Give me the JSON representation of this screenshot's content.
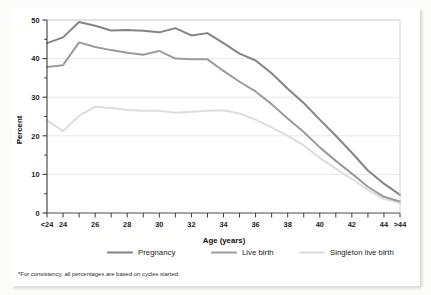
{
  "figure": {
    "footnote": "*For consistency, all percentages are based on cycles started."
  },
  "chart_data": {
    "type": "line",
    "title": "",
    "xlabel": "Age (years)",
    "ylabel": "Percent",
    "categories": [
      "<24",
      "24",
      "25",
      "26",
      "27",
      "28",
      "29",
      "30",
      "31",
      "32",
      "33",
      "34",
      "35",
      "36",
      "37",
      "38",
      "39",
      "40",
      "41",
      "42",
      "43",
      "44",
      ">44"
    ],
    "xlim": [
      0,
      22
    ],
    "ylim": [
      0,
      50
    ],
    "yticks": [
      0,
      10,
      20,
      30,
      40,
      50
    ],
    "ytick_labels": [
      "0",
      "10",
      "20",
      "30",
      "40",
      "50"
    ],
    "y_minor_ticks": [
      5,
      15,
      25,
      35,
      45
    ],
    "grid": "horizontal",
    "legend_position": "below-axis",
    "series": [
      {
        "name": "Pregnancy",
        "color": "#848484",
        "values": [
          44.0,
          45.5,
          49.5,
          48.5,
          47.3,
          47.4,
          47.2,
          46.8,
          47.9,
          46.0,
          46.6,
          44.0,
          41.3,
          39.5,
          36.2,
          32.2,
          28.5,
          24.2,
          20.0,
          15.6,
          11.0,
          7.6,
          4.7
        ]
      },
      {
        "name": "Live birth",
        "color": "#9b9b9b",
        "values": [
          37.8,
          38.3,
          44.2,
          43.0,
          42.2,
          41.5,
          41.0,
          42.0,
          40.0,
          39.8,
          39.8,
          36.8,
          34.0,
          31.5,
          28.2,
          24.5,
          21.0,
          17.0,
          13.5,
          10.2,
          6.8,
          4.2,
          3.0
        ]
      },
      {
        "name": "Singleton live birth",
        "color": "#dddddd",
        "values": [
          24.0,
          21.2,
          25.2,
          27.5,
          27.2,
          26.7,
          26.5,
          26.5,
          26.0,
          26.2,
          26.5,
          26.6,
          25.8,
          24.2,
          22.2,
          20.0,
          17.5,
          14.3,
          11.5,
          8.8,
          6.0,
          3.6,
          2.6
        ]
      }
    ],
    "legend": [
      {
        "label": "Pregnancy",
        "color": "#848484"
      },
      {
        "label": "Live birth",
        "color": "#9b9b9b"
      },
      {
        "label": "Singleton live birth",
        "color": "#dddddd"
      }
    ]
  }
}
